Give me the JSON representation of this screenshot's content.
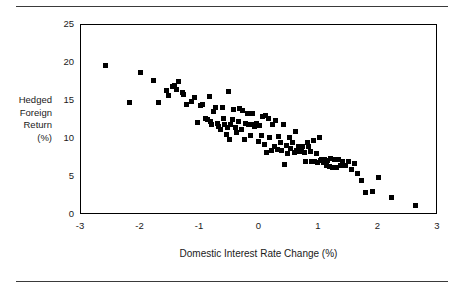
{
  "chart_data": {
    "type": "scatter",
    "title": "",
    "xlabel": "Domestic Interest Rate Change (%)",
    "ylabel": "Hedged Foreign Return (%)",
    "ylabel_lines": [
      "Hedged",
      "Foreign",
      "Return",
      "(%)"
    ],
    "xlim": [
      -3,
      3
    ],
    "ylim": [
      0,
      25
    ],
    "xticks": [
      -3,
      -2,
      -1,
      0,
      1,
      2,
      3
    ],
    "xtick_labels": [
      "-3",
      "-2",
      "-1",
      "0",
      "1",
      "2",
      "3"
    ],
    "yticks": [
      0,
      5,
      10,
      15,
      20,
      25
    ],
    "ytick_labels": [
      "0",
      "5",
      "10",
      "15",
      "20",
      "25"
    ],
    "grid": false,
    "legend": null,
    "marker": "square",
    "marker_color": "#000000",
    "points": [
      [
        -2.58,
        19.7
      ],
      [
        -2.18,
        14.8
      ],
      [
        -2.0,
        18.8
      ],
      [
        -1.79,
        17.65
      ],
      [
        -1.69,
        14.8
      ],
      [
        -1.56,
        16.35
      ],
      [
        -1.53,
        15.7
      ],
      [
        -1.46,
        16.95
      ],
      [
        -1.43,
        17.1
      ],
      [
        -1.4,
        16.55
      ],
      [
        -1.36,
        17.6
      ],
      [
        -1.3,
        16.15
      ],
      [
        -1.27,
        15.9
      ],
      [
        -1.23,
        14.6
      ],
      [
        -1.15,
        14.95
      ],
      [
        -1.1,
        15.5
      ],
      [
        -1.04,
        12.15
      ],
      [
        -1.0,
        14.35
      ],
      [
        -0.95,
        14.55
      ],
      [
        -0.9,
        12.7
      ],
      [
        -0.87,
        12.55
      ],
      [
        -0.84,
        15.55
      ],
      [
        -0.82,
        12.3
      ],
      [
        -0.8,
        11.95
      ],
      [
        -0.78,
        13.6
      ],
      [
        -0.74,
        14.2
      ],
      [
        -0.71,
        12.0
      ],
      [
        -0.69,
        11.7
      ],
      [
        -0.66,
        11.25
      ],
      [
        -0.63,
        14.1
      ],
      [
        -0.6,
        12.75
      ],
      [
        -0.58,
        11.9
      ],
      [
        -0.56,
        10.6
      ],
      [
        -0.54,
        11.55
      ],
      [
        -0.52,
        16.3
      ],
      [
        -0.5,
        10.0
      ],
      [
        -0.48,
        11.85
      ],
      [
        -0.45,
        12.6
      ],
      [
        -0.43,
        13.9
      ],
      [
        -0.4,
        11.45
      ],
      [
        -0.38,
        10.85
      ],
      [
        -0.35,
        12.35
      ],
      [
        -0.33,
        14.05
      ],
      [
        -0.3,
        11.2
      ],
      [
        -0.28,
        13.7
      ],
      [
        -0.26,
        10.0
      ],
      [
        -0.24,
        12.0
      ],
      [
        -0.21,
        13.35
      ],
      [
        -0.19,
        11.85
      ],
      [
        -0.17,
        11.95
      ],
      [
        -0.15,
        10.4
      ],
      [
        -0.12,
        13.3
      ],
      [
        -0.1,
        11.9
      ],
      [
        -0.08,
        11.65
      ],
      [
        -0.05,
        12.05
      ],
      [
        -0.02,
        9.7
      ],
      [
        0.0,
        11.8
      ],
      [
        0.03,
        10.5
      ],
      [
        0.05,
        12.9
      ],
      [
        0.08,
        9.3
      ],
      [
        0.1,
        13.05
      ],
      [
        0.12,
        8.25
      ],
      [
        0.15,
        12.75
      ],
      [
        0.17,
        10.15
      ],
      [
        0.2,
        8.55
      ],
      [
        0.22,
        11.95
      ],
      [
        0.25,
        9.05
      ],
      [
        0.27,
        12.4
      ],
      [
        0.3,
        8.6
      ],
      [
        0.32,
        10.35
      ],
      [
        0.35,
        9.55
      ],
      [
        0.37,
        8.5
      ],
      [
        0.4,
        11.9
      ],
      [
        0.42,
        6.6
      ],
      [
        0.45,
        9.2
      ],
      [
        0.47,
        8.15
      ],
      [
        0.5,
        10.25
      ],
      [
        0.52,
        8.75
      ],
      [
        0.55,
        9.6
      ],
      [
        0.58,
        8.2
      ],
      [
        0.6,
        11.0
      ],
      [
        0.62,
        8.45
      ],
      [
        0.65,
        9.0
      ],
      [
        0.67,
        8.3
      ],
      [
        0.7,
        8.6
      ],
      [
        0.72,
        9.0
      ],
      [
        0.75,
        8.25
      ],
      [
        0.78,
        7.0
      ],
      [
        0.8,
        9.6
      ],
      [
        0.82,
        8.95
      ],
      [
        0.85,
        8.35
      ],
      [
        0.88,
        7.05
      ],
      [
        0.9,
        9.8
      ],
      [
        0.92,
        7.1
      ],
      [
        0.95,
        8.15
      ],
      [
        0.98,
        6.9
      ],
      [
        1.0,
        10.25
      ],
      [
        1.02,
        7.15
      ],
      [
        1.05,
        7.35
      ],
      [
        1.08,
        6.85
      ],
      [
        1.1,
        7.3
      ],
      [
        1.13,
        6.5
      ],
      [
        1.15,
        7.2
      ],
      [
        1.18,
        6.35
      ],
      [
        1.2,
        7.4
      ],
      [
        1.23,
        6.3
      ],
      [
        1.26,
        7.35
      ],
      [
        1.3,
        6.2
      ],
      [
        1.33,
        7.25
      ],
      [
        1.36,
        6.55
      ],
      [
        1.4,
        7.05
      ],
      [
        1.45,
        6.45
      ],
      [
        1.5,
        7.1
      ],
      [
        1.55,
        5.95
      ],
      [
        1.6,
        6.8
      ],
      [
        1.65,
        5.4
      ],
      [
        1.72,
        4.55
      ],
      [
        1.78,
        3.0
      ],
      [
        1.9,
        3.05
      ],
      [
        2.0,
        4.95
      ],
      [
        2.22,
        2.3
      ],
      [
        2.62,
        1.2
      ]
    ],
    "n_points": 122
  },
  "figure": {
    "rule_color": "#3a3a3a",
    "frame_color": "#000000",
    "background": "#ffffff"
  }
}
